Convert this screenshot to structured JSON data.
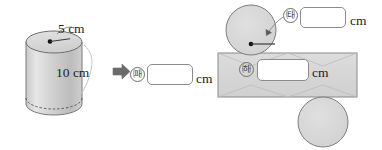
{
  "figure": {
    "colors": {
      "solid_fill": "#d4d4d4",
      "solid_fill_light": "#e0e0e0",
      "net_fill": "#d9d9d9",
      "outline": "#6e6e6e",
      "leader_line": "#8c8c8c",
      "text": "#231f20",
      "box_border": "#8c8c8c",
      "box_fill": "#ffffff",
      "arrow": "#6b6b6b"
    },
    "left_solid": {
      "name": "cylinder",
      "radius_label": "5 cm",
      "height_label": "10 cm",
      "radius_value": "5",
      "height_value": "10",
      "unit": "cm"
    },
    "transform_arrow": {
      "icon": "right-arrow-icon",
      "direction": "right"
    },
    "answers": [
      {
        "key": "b",
        "marker": "ㅣ",
        "marker_label": "㈚",
        "value": "",
        "unit": "cm",
        "refers_to": "cylinder-height"
      },
      {
        "key": "a",
        "marker_label": "㈙",
        "value": "",
        "unit": "cm",
        "refers_to": "base-circle-radius"
      },
      {
        "key": "c",
        "marker_label": "㈛",
        "value": "",
        "unit": "cm",
        "refers_to": "lateral-rectangle-width"
      }
    ],
    "right_net": {
      "name": "cylinder-net",
      "top_circle": "base-circle-top",
      "bottom_circle": "base-circle-bottom",
      "rectangle": "lateral-surface-rectangle",
      "radius_arrow": "radius-arrow"
    }
  }
}
